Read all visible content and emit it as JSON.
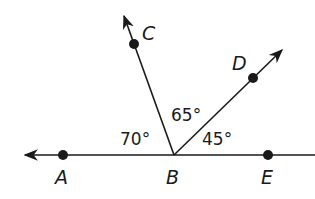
{
  "diagram": {
    "type": "geometry-angles",
    "colors": {
      "stroke": "#1a1a1a",
      "background": "#ffffff"
    },
    "points": {
      "A": {
        "label": "A"
      },
      "B": {
        "label": "B"
      },
      "C": {
        "label": "C"
      },
      "D": {
        "label": "D"
      },
      "E": {
        "label": "E"
      }
    },
    "angles": {
      "ABC": "70°",
      "CBD": "65°",
      "DBE": "45°"
    },
    "rays": [
      "BA",
      "BC",
      "BD",
      "BE"
    ]
  }
}
